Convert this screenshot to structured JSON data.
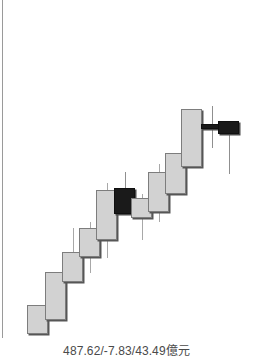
{
  "panel": {
    "name": "kline-panel",
    "background": "#ffffff",
    "border_color": "#9a9a9a"
  },
  "footer": {
    "label": "487.62/-7.83/43.49億元"
  },
  "chart_data": {
    "type": "candlestick",
    "title": "",
    "xlabel": "",
    "ylabel": "",
    "grid": false,
    "legend": null,
    "annotations": [
      "487.62/-7.83/43.49億元"
    ],
    "colors": {
      "up_fill": "#d2d2d2",
      "up_border": "#7d7d7d",
      "down_fill": "#1a1a1a",
      "down_border": "#101010",
      "wick": "#a8a8a8",
      "shadow": "#565656"
    },
    "ylim": [
      0,
      338
    ],
    "note": "Pixel geometry: y measured from top of chart area; body_top/body_bottom and wick_top/wick_bottom are pixel rows. direction 'up' = light body, 'down' = black body.",
    "candles": [
      {
        "index": 1,
        "direction": "up",
        "x": 27,
        "width": 21,
        "body_top": 305,
        "body_bottom": 334,
        "wick_top": 305,
        "wick_bottom": 334
      },
      {
        "index": 2,
        "direction": "up",
        "x": 45,
        "width": 21,
        "body_top": 272,
        "body_bottom": 320,
        "wick_top": 272,
        "wick_bottom": 320
      },
      {
        "index": 3,
        "direction": "up",
        "x": 62,
        "width": 21,
        "body_top": 252,
        "body_bottom": 282,
        "wick_top": 228,
        "wick_bottom": 282
      },
      {
        "index": 4,
        "direction": "up",
        "x": 79,
        "width": 21,
        "body_top": 228,
        "body_bottom": 257,
        "wick_top": 222,
        "wick_bottom": 273
      },
      {
        "index": 5,
        "direction": "up",
        "x": 96,
        "width": 21,
        "body_top": 190,
        "body_bottom": 240,
        "wick_top": 183,
        "wick_bottom": 258
      },
      {
        "index": 6,
        "direction": "down",
        "x": 114,
        "width": 21,
        "body_top": 188,
        "body_bottom": 214,
        "wick_top": 172,
        "wick_bottom": 214
      },
      {
        "index": 7,
        "direction": "up",
        "x": 131,
        "width": 21,
        "body_top": 198,
        "body_bottom": 218,
        "wick_top": 194,
        "wick_bottom": 240
      },
      {
        "index": 8,
        "direction": "up",
        "x": 148,
        "width": 21,
        "body_top": 172,
        "body_bottom": 212,
        "wick_top": 164,
        "wick_bottom": 222
      },
      {
        "index": 9,
        "direction": "up",
        "x": 165,
        "width": 21,
        "body_top": 153,
        "body_bottom": 194,
        "wick_top": 153,
        "wick_bottom": 194
      },
      {
        "index": 10,
        "direction": "up",
        "x": 181,
        "width": 21,
        "body_top": 109,
        "body_bottom": 167,
        "wick_top": 109,
        "wick_bottom": 167
      },
      {
        "index": 11,
        "direction": "down",
        "x": 201,
        "width": 21,
        "body_top": 124,
        "body_bottom": 129,
        "wick_top": 106,
        "wick_bottom": 148
      },
      {
        "index": 12,
        "direction": "down",
        "x": 218,
        "width": 21,
        "body_top": 121,
        "body_bottom": 134,
        "wick_top": 121,
        "wick_bottom": 174
      }
    ]
  }
}
